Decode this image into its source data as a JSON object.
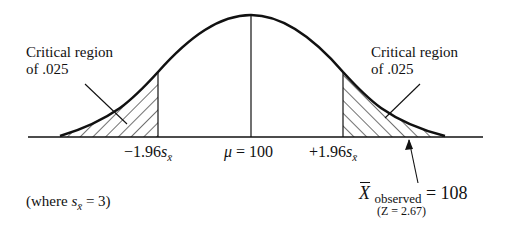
{
  "diagram": {
    "type": "normal-distribution-two-tailed-test",
    "labels": {
      "left_region_line1": "Critical region",
      "left_region_line2": "of .025",
      "right_region_line1": "Critical region",
      "right_region_line2": "of .025",
      "left_tick_prefix": "−1.96",
      "left_tick_s": "s",
      "left_tick_sub": "x̄",
      "mu_symbol": "μ",
      "mu_value": " = 100",
      "right_tick_prefix": "+1.96",
      "right_tick_s": "s",
      "right_tick_sub": "x̄",
      "observed_symbol": "X",
      "observed_sub": "observed",
      "observed_value": " = 108",
      "observed_z": "(Z = 2.67)",
      "where_prefix": "(where ",
      "where_s": "s",
      "where_sub": "x̄",
      "where_suffix": " = 3)"
    },
    "values": {
      "mean": 100,
      "critical_z": 1.96,
      "alpha_per_tail": 0.025,
      "observed_mean": 108,
      "observed_z": 2.67,
      "standard_error": 3
    },
    "colors": {
      "ink": "#111111",
      "background": "#ffffff"
    }
  }
}
